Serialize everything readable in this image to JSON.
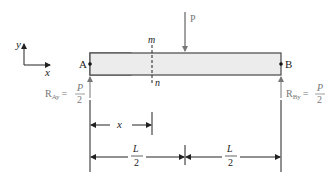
{
  "diagram": {
    "axes": {
      "x_label": "x",
      "y_label": "y"
    },
    "load": {
      "label": "P"
    },
    "supports": {
      "left": {
        "point": "A",
        "reaction_prefix": "R",
        "reaction_sub": "Ay",
        "eq": "=",
        "num": "P",
        "den": "2"
      },
      "right": {
        "point": "B",
        "reaction_prefix": "R",
        "reaction_sub": "By",
        "eq": "=",
        "num": "P",
        "den": "2"
      }
    },
    "section": {
      "top": "m",
      "bottom": "n"
    },
    "dimensions": {
      "x": "x",
      "left_half": {
        "num": "L",
        "den": "2"
      },
      "right_half": {
        "num": "L",
        "den": "2"
      }
    },
    "colors": {
      "beam_fill": "#ececec",
      "beam_stroke": "#555555",
      "line": "#222222",
      "gray_text": "#777777"
    }
  }
}
